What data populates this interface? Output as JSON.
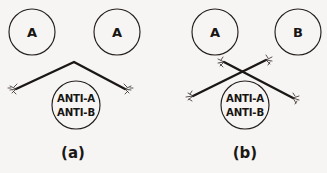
{
  "figure": {
    "background_color": "#f6f5f3",
    "ink_color": "#1b1715",
    "panels": [
      {
        "id": "panel-a",
        "caption": "(a)",
        "caption_x": 73,
        "caption_y": 153,
        "description": "Two identical type-A cells bridged by one antibody whose two arms bind the same antigen",
        "cells": [
          {
            "label": "A",
            "cx": 32,
            "cy": 32,
            "r": 23
          },
          {
            "label": "A",
            "cx": 117,
            "cy": 32,
            "r": 23
          }
        ],
        "antibody_source": {
          "lines": [
            "ANTI-A",
            "ANTI-B"
          ],
          "cx": 76,
          "cy": 105,
          "r": 24
        },
        "links": [
          {
            "shape": "chevron",
            "points": [
              [
                15,
                90
              ],
              [
                74,
                62
              ],
              [
                126,
                90
              ]
            ],
            "tips": [
              [
                15,
                90
              ],
              [
                126,
                90
              ]
            ]
          }
        ]
      },
      {
        "id": "panel-b",
        "caption": "(b)",
        "caption_x": 245,
        "caption_y": 153,
        "description": "One type-A cell and one type-B cell crosslinked by two antibodies forming an X",
        "cells": [
          {
            "label": "A",
            "cx": 215,
            "cy": 32,
            "r": 23
          },
          {
            "label": "B",
            "cx": 298,
            "cy": 32,
            "r": 23
          }
        ],
        "antibody_source": {
          "lines": [
            "ANTI-A",
            "ANTI-B"
          ],
          "cx": 245,
          "cy": 105,
          "r": 24
        },
        "links": [
          {
            "shape": "line",
            "points": [
              [
                191,
                97
              ],
              [
                268,
                59
              ]
            ],
            "tips": [
              [
                191,
                97
              ],
              [
                268,
                59
              ]
            ]
          },
          {
            "shape": "line",
            "points": [
              [
                222,
                61
              ],
              [
                295,
                99
              ]
            ],
            "tips": [
              [
                222,
                61
              ],
              [
                295,
                99
              ]
            ]
          }
        ]
      }
    ]
  }
}
